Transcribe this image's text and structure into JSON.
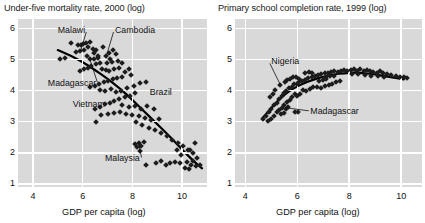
{
  "figure": {
    "background": "#ffffff",
    "plot_background": "#d9d9d9",
    "gridline_color": "#ffffff",
    "marker_color": "#1c1c1c",
    "trend_color": "#000000"
  },
  "panels": [
    {
      "id": "left",
      "title": "Under-five mortality rate, 2000 (log)",
      "xlabel": "GDP per capita (log)"
    },
    {
      "id": "right",
      "title": "Primary school completion rate, 1999 (log)",
      "xlabel": "GDP per capita (log)"
    }
  ],
  "chart_data": [
    {
      "type": "scatter",
      "title": "Under-five mortality rate, 2000 (log)",
      "xlabel": "GDP per capita (log)",
      "ylabel": "",
      "xlim": [
        3.4,
        11.0
      ],
      "ylim": [
        0.9,
        6.3
      ],
      "xticks": [
        4,
        6,
        8,
        10
      ],
      "yticks": [
        1,
        2,
        3,
        4,
        5,
        6
      ],
      "grid": true,
      "legend": "none",
      "trend": {
        "type": "lowess",
        "points": [
          [
            5.0,
            5.3
          ],
          [
            5.5,
            5.13
          ],
          [
            6.0,
            4.92
          ],
          [
            6.5,
            4.66
          ],
          [
            7.0,
            4.38
          ],
          [
            7.5,
            4.07
          ],
          [
            8.0,
            3.7
          ],
          [
            8.5,
            3.31
          ],
          [
            9.0,
            2.92
          ],
          [
            9.5,
            2.53
          ],
          [
            10.0,
            2.1
          ],
          [
            10.5,
            1.7
          ],
          [
            10.8,
            1.5
          ]
        ]
      },
      "annotations": [
        {
          "label": "Malawi",
          "text_x": 5.0,
          "text_y": 5.93,
          "point_x": 5.92,
          "point_y": 5.28
        },
        {
          "label": "Cambodia",
          "text_x": 7.3,
          "text_y": 5.93,
          "point_x": 6.95,
          "point_y": 5.1
        },
        {
          "label": "Madagascar",
          "text_x": 4.6,
          "text_y": 4.22,
          "point_x": 6.3,
          "point_y": 4.98
        },
        {
          "label": "Vietnam",
          "text_x": 5.6,
          "text_y": 3.52,
          "point_x": 5.6,
          "point_y": 3.52
        },
        {
          "label": "Brazil",
          "text_x": 8.7,
          "text_y": 3.93,
          "point_x": 8.7,
          "point_y": 3.93
        },
        {
          "label": "Malaysia",
          "text_x": 6.9,
          "text_y": 1.8,
          "point_x": 8.25,
          "point_y": 2.3
        }
      ],
      "points": [
        [
          5.55,
          5.53
        ],
        [
          5.8,
          5.47
        ],
        [
          5.95,
          5.45
        ],
        [
          6.0,
          5.5
        ],
        [
          6.12,
          5.52
        ],
        [
          6.2,
          5.41
        ],
        [
          6.3,
          5.56
        ],
        [
          6.4,
          5.34
        ],
        [
          6.05,
          5.3
        ],
        [
          5.88,
          5.28
        ],
        [
          5.72,
          5.24
        ],
        [
          6.45,
          5.22
        ],
        [
          6.55,
          5.3
        ],
        [
          6.6,
          5.12
        ],
        [
          6.18,
          5.1
        ],
        [
          6.3,
          5.03
        ],
        [
          6.45,
          5.02
        ],
        [
          6.62,
          5.04
        ],
        [
          5.3,
          5.04
        ],
        [
          5.1,
          5.02
        ],
        [
          6.8,
          5.4
        ],
        [
          6.95,
          5.12
        ],
        [
          7.05,
          5.22
        ],
        [
          7.1,
          5.02
        ],
        [
          7.2,
          5.3
        ],
        [
          7.35,
          5.18
        ],
        [
          7.18,
          4.92
        ],
        [
          7.42,
          4.96
        ],
        [
          6.98,
          4.88
        ],
        [
          6.7,
          4.9
        ],
        [
          6.52,
          4.86
        ],
        [
          6.35,
          4.8
        ],
        [
          6.2,
          4.72
        ],
        [
          6.05,
          4.68
        ],
        [
          5.9,
          4.62
        ],
        [
          6.78,
          4.7
        ],
        [
          6.92,
          4.66
        ],
        [
          7.05,
          4.62
        ],
        [
          7.25,
          4.7
        ],
        [
          7.48,
          4.72
        ],
        [
          7.58,
          4.88
        ],
        [
          7.7,
          4.6
        ],
        [
          7.85,
          4.7
        ],
        [
          7.95,
          4.5
        ],
        [
          7.6,
          4.42
        ],
        [
          7.4,
          4.4
        ],
        [
          7.2,
          4.38
        ],
        [
          7.02,
          4.32
        ],
        [
          6.85,
          4.28
        ],
        [
          6.65,
          4.22
        ],
        [
          6.5,
          4.16
        ],
        [
          6.3,
          4.12
        ],
        [
          6.7,
          4.02
        ],
        [
          6.9,
          3.98
        ],
        [
          7.15,
          4.04
        ],
        [
          7.35,
          3.96
        ],
        [
          7.55,
          4.0
        ],
        [
          7.8,
          4.08
        ],
        [
          8.05,
          4.16
        ],
        [
          8.3,
          4.24
        ],
        [
          8.55,
          4.28
        ],
        [
          8.12,
          3.92
        ],
        [
          7.92,
          3.84
        ],
        [
          7.7,
          3.78
        ],
        [
          7.48,
          3.72
        ],
        [
          7.28,
          3.66
        ],
        [
          7.08,
          3.6
        ],
        [
          6.88,
          3.56
        ],
        [
          6.68,
          3.48
        ],
        [
          6.48,
          3.42
        ],
        [
          7.6,
          3.52
        ],
        [
          7.85,
          3.46
        ],
        [
          8.1,
          3.5
        ],
        [
          8.35,
          3.42
        ],
        [
          8.6,
          3.5
        ],
        [
          8.85,
          3.42
        ],
        [
          9.05,
          3.1
        ],
        [
          8.75,
          3.06
        ],
        [
          8.5,
          3.12
        ],
        [
          8.25,
          3.18
        ],
        [
          8.0,
          3.22
        ],
        [
          7.75,
          3.26
        ],
        [
          7.5,
          3.3
        ],
        [
          7.25,
          3.28
        ],
        [
          7.0,
          3.24
        ],
        [
          6.75,
          3.2
        ],
        [
          6.55,
          2.98
        ],
        [
          8.15,
          2.98
        ],
        [
          8.4,
          2.88
        ],
        [
          8.65,
          2.8
        ],
        [
          8.9,
          2.72
        ],
        [
          9.15,
          2.62
        ],
        [
          9.4,
          2.54
        ],
        [
          9.6,
          2.42
        ],
        [
          9.85,
          2.32
        ],
        [
          10.05,
          2.22
        ],
        [
          10.25,
          2.1
        ],
        [
          10.45,
          1.98
        ],
        [
          10.6,
          1.84
        ],
        [
          10.7,
          1.62
        ],
        [
          10.55,
          1.56
        ],
        [
          10.35,
          1.62
        ],
        [
          10.18,
          1.7
        ],
        [
          10.42,
          1.72
        ],
        [
          10.28,
          1.48
        ],
        [
          10.1,
          1.52
        ],
        [
          9.92,
          1.68
        ],
        [
          9.72,
          1.7
        ],
        [
          9.52,
          1.66
        ],
        [
          9.35,
          1.6
        ],
        [
          9.15,
          1.72
        ],
        [
          8.95,
          1.66
        ],
        [
          8.55,
          1.6
        ],
        [
          8.25,
          2.32
        ],
        [
          8.35,
          2.22
        ],
        [
          8.45,
          2.36
        ],
        [
          8.2,
          2.18
        ],
        [
          8.1,
          2.28
        ],
        [
          8.3,
          2.06
        ],
        [
          9.8,
          2.1
        ],
        [
          10.3,
          2.08
        ],
        [
          9.95,
          1.92
        ],
        [
          10.5,
          2.3
        ]
      ]
    },
    {
      "type": "scatter",
      "title": "Primary school completion rate, 1999 (log)",
      "xlabel": "GDP per capita (log)",
      "ylabel": "",
      "xlim": [
        3.6,
        10.8
      ],
      "ylim": [
        0.9,
        6.3
      ],
      "xticks": [
        4,
        6,
        8,
        10
      ],
      "yticks": [
        1,
        2,
        3,
        4,
        5,
        6
      ],
      "grid": true,
      "legend": "none",
      "trend": {
        "type": "lowess",
        "points": [
          [
            4.65,
            3.1
          ],
          [
            5.0,
            3.45
          ],
          [
            5.4,
            3.8
          ],
          [
            5.8,
            4.05
          ],
          [
            6.2,
            4.22
          ],
          [
            6.6,
            4.35
          ],
          [
            7.0,
            4.45
          ],
          [
            7.4,
            4.52
          ],
          [
            7.8,
            4.56
          ],
          [
            8.2,
            4.58
          ],
          [
            8.6,
            4.56
          ],
          [
            9.0,
            4.52
          ],
          [
            9.4,
            4.46
          ],
          [
            9.8,
            4.4
          ],
          [
            10.1,
            4.36
          ]
        ]
      },
      "annotations": [
        {
          "label": "Nigeria",
          "text_x": 5.0,
          "text_y": 4.92,
          "point_x": 5.35,
          "point_y": 4.18
        },
        {
          "label": "Madagascar",
          "text_x": 6.5,
          "text_y": 3.3,
          "point_x": 5.52,
          "point_y": 3.45
        }
      ],
      "points": [
        [
          4.68,
          3.08
        ],
        [
          4.8,
          3.18
        ],
        [
          4.92,
          3.32
        ],
        [
          5.0,
          3.4
        ],
        [
          5.1,
          3.52
        ],
        [
          5.2,
          3.6
        ],
        [
          5.3,
          3.72
        ],
        [
          5.4,
          3.84
        ],
        [
          5.48,
          3.92
        ],
        [
          5.58,
          4.0
        ],
        [
          5.68,
          4.08
        ],
        [
          5.78,
          4.12
        ],
        [
          5.88,
          4.2
        ],
        [
          5.98,
          4.22
        ],
        [
          6.08,
          4.26
        ],
        [
          6.18,
          4.3
        ],
        [
          5.35,
          4.18
        ],
        [
          5.52,
          4.28
        ],
        [
          5.15,
          4.02
        ],
        [
          5.05,
          3.88
        ],
        [
          4.95,
          3.78
        ],
        [
          5.6,
          4.34
        ],
        [
          5.72,
          4.38
        ],
        [
          5.82,
          4.44
        ],
        [
          5.95,
          4.42
        ],
        [
          6.05,
          4.38
        ],
        [
          6.3,
          4.34
        ],
        [
          6.42,
          4.4
        ],
        [
          6.55,
          4.44
        ],
        [
          6.68,
          4.48
        ],
        [
          6.8,
          4.5
        ],
        [
          6.92,
          4.52
        ],
        [
          7.05,
          4.56
        ],
        [
          7.18,
          4.58
        ],
        [
          7.3,
          4.6
        ],
        [
          7.42,
          4.62
        ],
        [
          7.55,
          4.6
        ],
        [
          7.68,
          4.64
        ],
        [
          7.8,
          4.66
        ],
        [
          7.92,
          4.62
        ],
        [
          8.05,
          4.66
        ],
        [
          8.18,
          4.68
        ],
        [
          8.3,
          4.64
        ],
        [
          8.42,
          4.68
        ],
        [
          8.55,
          4.64
        ],
        [
          8.68,
          4.66
        ],
        [
          8.8,
          4.62
        ],
        [
          8.92,
          4.6
        ],
        [
          9.05,
          4.58
        ],
        [
          9.18,
          4.62
        ],
        [
          9.3,
          4.56
        ],
        [
          9.45,
          4.54
        ],
        [
          9.6,
          4.5
        ],
        [
          9.78,
          4.48
        ],
        [
          9.95,
          4.44
        ],
        [
          10.1,
          4.42
        ],
        [
          10.22,
          4.4
        ],
        [
          6.2,
          4.02
        ],
        [
          6.35,
          3.98
        ],
        [
          6.5,
          4.04
        ],
        [
          6.62,
          4.1
        ],
        [
          6.75,
          4.12
        ],
        [
          6.9,
          4.08
        ],
        [
          7.05,
          4.14
        ],
        [
          7.2,
          4.18
        ],
        [
          7.35,
          4.22
        ],
        [
          7.5,
          4.26
        ],
        [
          7.65,
          4.3
        ],
        [
          5.9,
          3.9
        ],
        [
          6.0,
          3.84
        ],
        [
          6.1,
          3.88
        ],
        [
          5.8,
          3.78
        ],
        [
          5.7,
          3.7
        ],
        [
          5.6,
          3.62
        ],
        [
          5.5,
          3.52
        ],
        [
          5.42,
          3.44
        ],
        [
          5.55,
          3.4
        ],
        [
          5.65,
          3.46
        ],
        [
          5.48,
          3.28
        ],
        [
          5.38,
          3.24
        ],
        [
          5.3,
          3.36
        ],
        [
          5.22,
          3.3
        ],
        [
          5.9,
          3.32
        ],
        [
          6.02,
          3.3
        ],
        [
          5.1,
          3.18
        ],
        [
          5.0,
          3.08
        ],
        [
          4.88,
          3.02
        ],
        [
          6.3,
          4.58
        ],
        [
          6.45,
          4.6
        ],
        [
          6.58,
          4.56
        ],
        [
          7.1,
          4.44
        ],
        [
          7.25,
          4.46
        ],
        [
          7.4,
          4.48
        ],
        [
          8.1,
          4.54
        ],
        [
          8.35,
          4.52
        ],
        [
          8.6,
          4.5
        ],
        [
          8.85,
          4.48
        ],
        [
          9.1,
          4.46
        ],
        [
          9.35,
          4.42
        ],
        [
          6.85,
          4.3
        ],
        [
          6.98,
          4.34
        ],
        [
          7.12,
          4.36
        ]
      ]
    }
  ]
}
